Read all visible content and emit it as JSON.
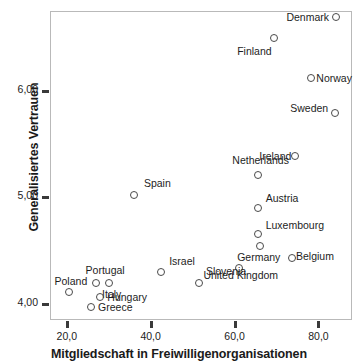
{
  "chart_data": {
    "type": "scatter",
    "title": "",
    "xlabel": "Mitgliedschaft in Freiwilligenorganisationen",
    "ylabel": "Generalisiertes Vertrauen",
    "xlim": [
      16.0,
      88.0
    ],
    "ylim": [
      3.85,
      6.75
    ],
    "xticks": [
      20,
      40,
      60,
      80
    ],
    "xticklabels": [
      "20,0",
      "40,0",
      "60,0",
      "80,0"
    ],
    "yticks": [
      4.0,
      5.0,
      6.0
    ],
    "yticklabels": [
      "4,00",
      "5,00",
      "6,00"
    ],
    "grid": false,
    "legend": null,
    "marker": "open-circle",
    "marker_color": "#4a4a4a",
    "points": [
      {
        "label": "Denmark",
        "x": 84.2,
        "y": 6.69,
        "lab_pos": "l",
        "lab_dx": -7,
        "lab_dy": 0
      },
      {
        "label": "Finland",
        "x": 69.5,
        "y": 6.5,
        "lab_pos": "c",
        "lab_dx": -20,
        "lab_dy": 8
      },
      {
        "label": "Norway",
        "x": 78.3,
        "y": 6.12,
        "lab_pos": "r",
        "lab_dx": 5,
        "lab_dy": 0
      },
      {
        "label": "Sweden",
        "x": 84.0,
        "y": 5.79,
        "lab_pos": "l",
        "lab_dx": -7,
        "lab_dy": -5
      },
      {
        "label": "Netherlands",
        "x": 65.5,
        "y": 5.21,
        "lab_pos": "c",
        "lab_dx": 3,
        "lab_dy": -20
      },
      {
        "label": "Ireland",
        "x": 74.5,
        "y": 5.39,
        "lab_pos": "l",
        "lab_dx": -4,
        "lab_dy": 0
      },
      {
        "label": "Austria",
        "x": 65.5,
        "y": 4.9,
        "lab_pos": "r",
        "lab_dx": 8,
        "lab_dy": -10
      },
      {
        "label": "Luxembourg",
        "x": 65.5,
        "y": 4.66,
        "lab_pos": "r",
        "lab_dx": 8,
        "lab_dy": -9
      },
      {
        "label": "Belgium",
        "x": 73.7,
        "y": 4.43,
        "lab_pos": "r",
        "lab_dx": 4,
        "lab_dy": -2
      },
      {
        "label": "Germany",
        "x": 66.0,
        "y": 4.54,
        "lab_pos": "c",
        "lab_dx": -1,
        "lab_dy": 6
      },
      {
        "label": "United Kingdom",
        "x": 61.0,
        "y": 4.34,
        "lab_pos": "c",
        "lab_dx": 2,
        "lab_dy": 2
      },
      {
        "label": "Spain",
        "x": 36.0,
        "y": 5.02,
        "lab_pos": "r",
        "lab_dx": 10,
        "lab_dy": -12
      },
      {
        "label": "Israel",
        "x": 42.5,
        "y": 4.3,
        "lab_pos": "r",
        "lab_dx": 8,
        "lab_dy": -11
      },
      {
        "label": "Slovenia",
        "x": 51.5,
        "y": 4.2,
        "lab_pos": "r",
        "lab_dx": 7,
        "lab_dy": -12
      },
      {
        "label": "Portugal",
        "x": 27.0,
        "y": 4.2,
        "lab_pos": "c",
        "lab_dx": 9,
        "lab_dy": -18
      },
      {
        "label": "Italy",
        "x": 30.0,
        "y": 4.2,
        "lab_pos": "c",
        "lab_dx": 3,
        "lab_dy": 6
      },
      {
        "label": "Poland",
        "x": 20.5,
        "y": 4.11,
        "lab_pos": "c",
        "lab_dx": 2,
        "lab_dy": -16
      },
      {
        "label": "Hungary",
        "x": 28.0,
        "y": 4.07,
        "lab_pos": "r",
        "lab_dx": 7,
        "lab_dy": 0
      },
      {
        "label": "Greece",
        "x": 25.8,
        "y": 3.97,
        "lab_pos": "r",
        "lab_dx": 7,
        "lab_dy": 0
      }
    ]
  }
}
